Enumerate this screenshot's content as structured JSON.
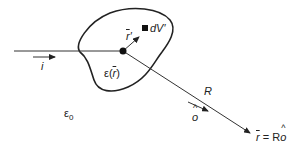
{
  "diagram": {
    "title": "",
    "labels": {
      "incident_dir": "i",
      "scatter_dir": "o",
      "distance": "R",
      "position_vec": "r",
      "position_vec_prime": "r",
      "prime": "′",
      "volume_element": "dV′",
      "permittivity_region": "ε(",
      "permittivity_region_r": "r",
      "permittivity_region_close": ")",
      "permittivity_background": "ε",
      "permittivity_background_sub": "0",
      "observation_point_eq": " = R",
      "observation_point_o": "o"
    },
    "colors": {
      "stroke": "#222222",
      "background": "#ffffff"
    }
  }
}
